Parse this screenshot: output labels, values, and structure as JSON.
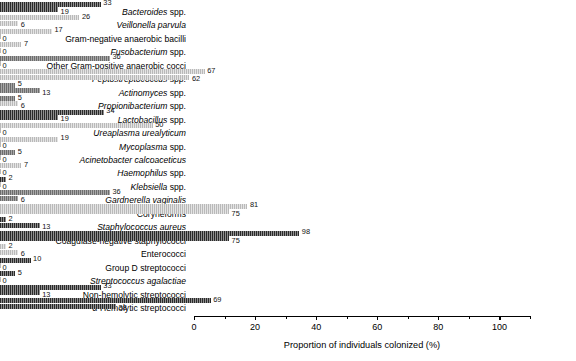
{
  "chart_data": {
    "type": "bar",
    "orientation": "horizontal",
    "title": "",
    "xlabel": "Proportion of individuals colonized (%)",
    "ylabel": "",
    "xlim": [
      0,
      110
    ],
    "xticks": [
      0,
      20,
      40,
      60,
      80,
      100
    ],
    "xtick_labels": [
      "0",
      "20",
      "40",
      "60",
      "80",
      "100"
    ],
    "grid": false,
    "legend": "none",
    "categories": [
      "Bacteroides spp.",
      "Veillonella parvula",
      "Gram-negative anaerobic bacilli",
      "Fusobacterium spp.",
      "Other Gram-positive anaerobic cocci",
      "Peptostreptococcus spp.",
      "Actinomyces spp.",
      "Propionibacterium spp.",
      "Lactobacillus spp.",
      "Ureaplasma urealyticum",
      "Mycoplasma spp.",
      "Acinetobacter calcoaceticus",
      "Haemophilus spp.",
      "Klebsiella spp.",
      "Gardnerella vaginalis",
      "Coryneforms",
      "Staphylococcus aureus",
      "Coagulase-negative staphylococci",
      "Enterococci",
      "Group D streptococci",
      "Streptococcus agalactiae",
      "Non-hemolytic streptococci",
      "α-Hemolytic streptococci"
    ],
    "series": [
      {
        "name": "upper-bar",
        "values": [
          33,
          26,
          17,
          7,
          36,
          67,
          13,
          6,
          34,
          50,
          19,
          5,
          7,
          2,
          36,
          81,
          13,
          98,
          6,
          10,
          5,
          33,
          69
        ]
      },
      {
        "name": "lower-bar",
        "values": [
          19,
          6,
          0,
          0,
          0,
          62,
          5,
          5,
          19,
          0,
          0,
          0,
          0,
          0,
          6,
          75,
          2,
          75,
          2,
          0,
          0,
          13,
          38
        ]
      }
    ]
  },
  "rows": [
    {
      "label": "Bacteroides spp.",
      "italic_part": "Bacteroides",
      "plain_part": " spp.",
      "upper": 33,
      "lower": 19,
      "upper_style": "dark",
      "lower_style": "dark"
    },
    {
      "label": "Veillonella parvula",
      "italic_part": "Veillonella parvula",
      "plain_part": "",
      "upper": 26,
      "lower": 6,
      "upper_style": "light",
      "lower_style": "light"
    },
    {
      "label": "Gram-negative anaerobic bacilli",
      "italic_part": "",
      "plain_part": "Gram-negative anaerobic bacilli",
      "upper": 17,
      "lower": 0,
      "upper_style": "light",
      "lower_style": "light"
    },
    {
      "label": "Fusobacterium spp.",
      "italic_part": "Fusobacterium",
      "plain_part": " spp.",
      "upper": 7,
      "lower": 0,
      "upper_style": "light",
      "lower_style": "light"
    },
    {
      "label": "Other Gram-positive anaerobic cocci",
      "italic_part": "",
      "plain_part": "Other Gram-positive anaerobic cocci",
      "upper": 36,
      "lower": 0,
      "upper_style": "mid",
      "lower_style": "light"
    },
    {
      "label": "Peptostreptococcus spp.",
      "italic_part": "Peptostreptococcus",
      "plain_part": " spp.",
      "upper": 67,
      "lower": 62,
      "upper_style": "light",
      "lower_style": "light"
    },
    {
      "label": "Actinomyces spp.",
      "italic_part": "Actinomyces",
      "plain_part": " spp.",
      "upper": 5,
      "lower": 13,
      "upper_style": "mid",
      "lower_style": "mid"
    },
    {
      "label": "Propionibacterium spp.",
      "italic_part": "Propionibacterium",
      "plain_part": " spp.",
      "upper": 5,
      "lower": 6,
      "upper_style": "mid",
      "lower_style": "light"
    },
    {
      "label": "Lactobacillus spp.",
      "italic_part": "Lactobacillus",
      "plain_part": " spp.",
      "upper": 34,
      "lower": 19,
      "upper_style": "dark",
      "lower_style": "dark"
    },
    {
      "label": "Ureaplasma urealyticum",
      "italic_part": "Ureaplasma urealyticum",
      "plain_part": "",
      "upper": 50,
      "lower": 0,
      "upper_style": "light",
      "lower_style": "light"
    },
    {
      "label": "Mycoplasma spp.",
      "italic_part": "Mycoplasma",
      "plain_part": " spp.",
      "upper": 19,
      "lower": 0,
      "upper_style": "light",
      "lower_style": "light"
    },
    {
      "label": "Acinetobacter calcoaceticus",
      "italic_part": "Acinetobacter calcoaceticus",
      "plain_part": "",
      "upper": 5,
      "lower": 0,
      "upper_style": "mid",
      "lower_style": "light"
    },
    {
      "label": "Haemophilus spp.",
      "italic_part": "Haemophilus",
      "plain_part": " spp.",
      "upper": 7,
      "lower": 0,
      "upper_style": "light",
      "lower_style": "light"
    },
    {
      "label": "Klebsiella spp.",
      "italic_part": "Klebsiella",
      "plain_part": " spp.",
      "upper": 2,
      "lower": 0,
      "upper_style": "dark",
      "lower_style": "light"
    },
    {
      "label": "Gardnerella vaginalis",
      "italic_part": "Gardnerella vaginalis",
      "plain_part": "",
      "upper": 36,
      "lower": 6,
      "upper_style": "mid",
      "lower_style": "mid"
    },
    {
      "label": "Coryneforms",
      "italic_part": "",
      "plain_part": "Coryneforms",
      "upper": 81,
      "lower": 75,
      "upper_style": "light",
      "lower_style": "light"
    },
    {
      "label": "Staphylococcus aureus",
      "italic_part": "Staphylococcus aureus",
      "plain_part": "",
      "upper": 2,
      "lower": 13,
      "upper_style": "dark",
      "lower_style": "dark"
    },
    {
      "label": "Coagulase-negative staphylococci",
      "italic_part": "",
      "plain_part": "Coagulase-negative staphylococci",
      "upper": 98,
      "lower": 75,
      "upper_style": "dark",
      "lower_style": "dark"
    },
    {
      "label": "Enterococci",
      "italic_part": "",
      "plain_part": "Enterococci",
      "upper": 2,
      "lower": 6,
      "upper_style": "light",
      "lower_style": "light"
    },
    {
      "label": "Group D streptococci",
      "italic_part": "",
      "plain_part": "Group D streptococci",
      "upper": 10,
      "lower": 0,
      "upper_style": "dark",
      "lower_style": "light"
    },
    {
      "label": "Streptococcus agalactiae",
      "italic_part": "Streptococcus agalactiae",
      "plain_part": "",
      "upper": 5,
      "lower": 0,
      "upper_style": "dark",
      "lower_style": "light"
    },
    {
      "label": "Non-hemolytic streptococci",
      "italic_part": "",
      "plain_part": "Non-hemolytic streptococci",
      "upper": 33,
      "lower": 13,
      "upper_style": "dark",
      "lower_style": "dark"
    },
    {
      "label": "α-Hemolytic streptococci",
      "italic_part": "",
      "plain_part": "α-Hemolytic streptococci",
      "upper": 69,
      "lower": 38,
      "upper_style": "dark",
      "lower_style": "dark"
    }
  ],
  "axis": {
    "x_title": "Proportion of individuals colonized (%)",
    "x_ticks": [
      "0",
      "20",
      "40",
      "60",
      "80",
      "100"
    ]
  }
}
